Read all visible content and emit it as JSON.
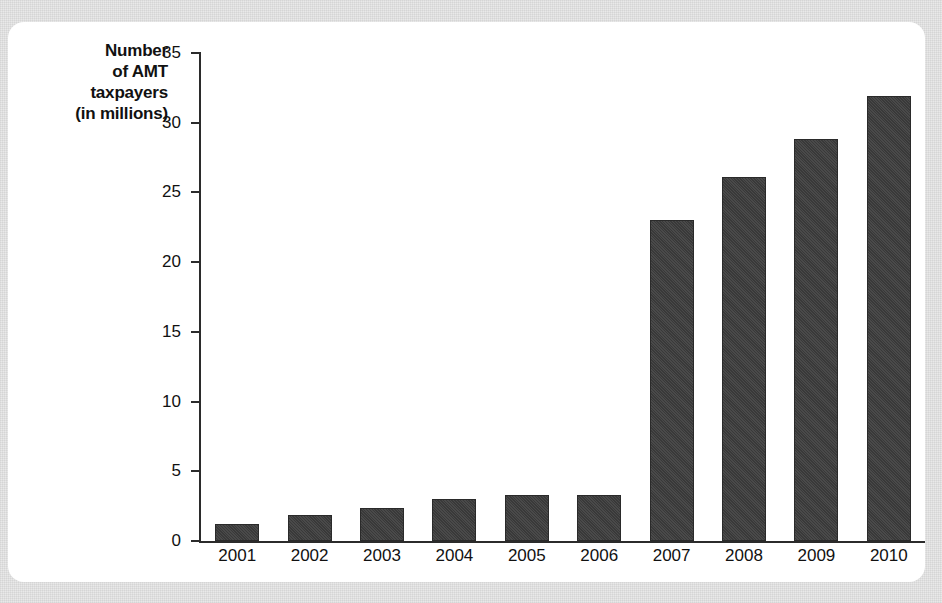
{
  "figure": {
    "caption": "The number of taxpayers affected by the AMT will increase",
    "card_background": "#ffffff",
    "page_background": "#e9e9e9"
  },
  "chart_data": {
    "type": "bar",
    "title": "",
    "subtitle": "",
    "ylabel": "Number of AMT taxpayers (in millions)",
    "ylabel_lines": [
      "Number",
      "of AMT",
      "taxpayers",
      "(in millions)"
    ],
    "xlabel": "",
    "categories": [
      "2001",
      "2002",
      "2003",
      "2004",
      "2005",
      "2006",
      "2007",
      "2008",
      "2009",
      "2010"
    ],
    "values": [
      1.2,
      1.9,
      2.4,
      3.0,
      3.3,
      3.3,
      23.0,
      26.1,
      28.8,
      31.9
    ],
    "ylim": [
      0,
      35
    ],
    "ytick_values": [
      0,
      5,
      10,
      15,
      20,
      25,
      30,
      35
    ],
    "ytick_labels": [
      "0",
      "5",
      "10",
      "15",
      "20",
      "25",
      "30",
      "35"
    ],
    "grid": false,
    "legend": null,
    "bar_color": "#3c3c3c",
    "axis_color": "#2b2b2b",
    "text_color": "#111111"
  }
}
